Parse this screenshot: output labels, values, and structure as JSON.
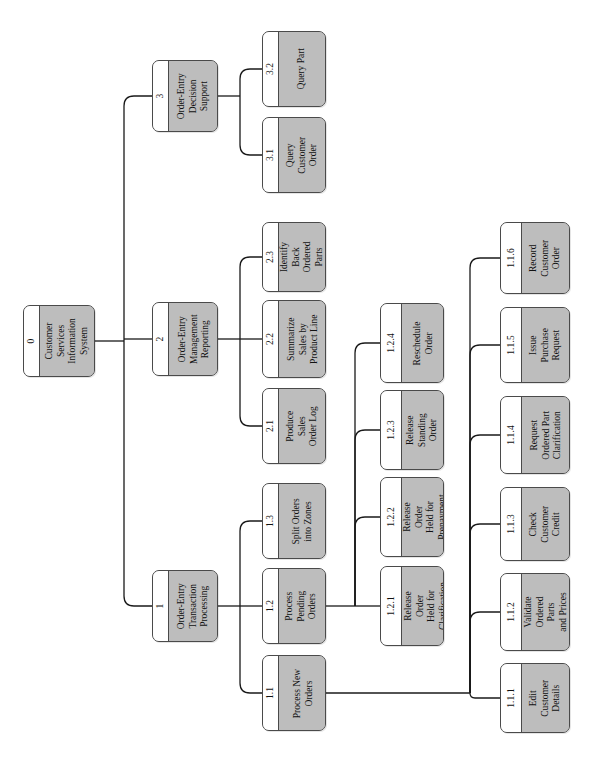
{
  "diagram": {
    "orientation": "rotated-90",
    "background_color": "#ffffff",
    "node_fill_color": "#bdbdbd",
    "node_id_strip_color": "#ffffff",
    "node_border_color": "#4a4a4a",
    "edge_color": "#1a1a1a"
  },
  "nodes": [
    {
      "key": "n0",
      "id": "0",
      "label": "Customer\nServices\nInformation\nSystem",
      "level": 0,
      "x": 23,
      "y": 305,
      "w": 72,
      "h": 72
    },
    {
      "key": "n1",
      "id": "1",
      "label": "Order-Entry\nTransaction\nProcessing",
      "level": 1,
      "x": 152,
      "y": 570,
      "w": 66,
      "h": 72
    },
    {
      "key": "n2",
      "id": "2",
      "label": "Order-Entry\nManagement\nReporting",
      "level": 1,
      "x": 152,
      "y": 302,
      "w": 66,
      "h": 74
    },
    {
      "key": "n3",
      "id": "3",
      "label": "Order-Entry\nDecision\nSupport",
      "level": 1,
      "x": 152,
      "y": 60,
      "w": 66,
      "h": 72
    },
    {
      "key": "n11",
      "id": "1.1",
      "label": "Process New\nOrders",
      "level": 2,
      "x": 262,
      "y": 655,
      "w": 64,
      "h": 76
    },
    {
      "key": "n12",
      "id": "1.2",
      "label": "Process\nPending\nOrders",
      "level": 2,
      "x": 262,
      "y": 568,
      "w": 64,
      "h": 76
    },
    {
      "key": "n13",
      "id": "1.3",
      "label": "Split Orders\ninto Zones",
      "level": 2,
      "x": 262,
      "y": 483,
      "w": 64,
      "h": 76
    },
    {
      "key": "n21",
      "id": "2.1",
      "label": "Produce\nSales\nOrder Log",
      "level": 2,
      "x": 262,
      "y": 388,
      "w": 64,
      "h": 76
    },
    {
      "key": "n22",
      "id": "2.2",
      "label": "Summarize\nSales by\nProduct Line",
      "level": 2,
      "x": 262,
      "y": 300,
      "w": 64,
      "h": 78
    },
    {
      "key": "n23",
      "id": "2.3",
      "label": "Identify\nBack\nOrdered\nParts",
      "level": 2,
      "x": 262,
      "y": 222,
      "w": 64,
      "h": 70
    },
    {
      "key": "n31",
      "id": "3.1",
      "label": "Query\nCustomer\nOrder",
      "level": 2,
      "x": 262,
      "y": 117,
      "w": 64,
      "h": 76
    },
    {
      "key": "n32",
      "id": "3.2",
      "label": "Query Part",
      "level": 2,
      "x": 262,
      "y": 31,
      "w": 64,
      "h": 76
    },
    {
      "key": "n121",
      "id": "1.2.1",
      "label": "Release\nOrder\nHeld for\nClarification",
      "level": 3,
      "x": 380,
      "y": 566,
      "w": 64,
      "h": 80
    },
    {
      "key": "n122",
      "id": "1.2.2",
      "label": "Release\nOrder\nHeld for\nPrepayment",
      "level": 3,
      "x": 380,
      "y": 477,
      "w": 64,
      "h": 80
    },
    {
      "key": "n123",
      "id": "1.2.3",
      "label": "Release\nStanding\nOrder",
      "level": 3,
      "x": 380,
      "y": 390,
      "w": 64,
      "h": 80
    },
    {
      "key": "n124",
      "id": "1.2.4",
      "label": "Reschedule\nOrder",
      "level": 3,
      "x": 380,
      "y": 303,
      "w": 64,
      "h": 80
    },
    {
      "key": "n111",
      "id": "1.1.1",
      "label": "Edit\nCustomer\nDetails",
      "level": 3,
      "x": 500,
      "y": 663,
      "w": 70,
      "h": 70
    },
    {
      "key": "n112",
      "id": "1.1.2",
      "label": "Validate\nOrdered\nParts\nand Prices",
      "level": 3,
      "x": 500,
      "y": 573,
      "w": 70,
      "h": 78
    },
    {
      "key": "n113",
      "id": "1.1.3",
      "label": "Check\nCustomer\nCredit",
      "level": 3,
      "x": 500,
      "y": 487,
      "w": 70,
      "h": 74
    },
    {
      "key": "n114",
      "id": "1.1.4",
      "label": "Request\nOrdered Part\nClarification",
      "level": 3,
      "x": 500,
      "y": 396,
      "w": 70,
      "h": 78
    },
    {
      "key": "n115",
      "id": "1.1.5",
      "label": "Issue\nPurchase\nRequest",
      "level": 3,
      "x": 500,
      "y": 307,
      "w": 70,
      "h": 76
    },
    {
      "key": "n116",
      "id": "1.1.6",
      "label": "Record\nCustomer\nOrder",
      "level": 3,
      "x": 500,
      "y": 222,
      "w": 70,
      "h": 72
    }
  ],
  "edges": [
    {
      "from": "0",
      "to": "1"
    },
    {
      "from": "0",
      "to": "2"
    },
    {
      "from": "0",
      "to": "3"
    },
    {
      "from": "1",
      "to": "1.1"
    },
    {
      "from": "1",
      "to": "1.2"
    },
    {
      "from": "1",
      "to": "1.3"
    },
    {
      "from": "2",
      "to": "2.1"
    },
    {
      "from": "2",
      "to": "2.2"
    },
    {
      "from": "2",
      "to": "2.3"
    },
    {
      "from": "3",
      "to": "3.1"
    },
    {
      "from": "3",
      "to": "3.2"
    },
    {
      "from": "1.2",
      "to": "1.2.1"
    },
    {
      "from": "1.2",
      "to": "1.2.2"
    },
    {
      "from": "1.2",
      "to": "1.2.3"
    },
    {
      "from": "1.2",
      "to": "1.2.4"
    },
    {
      "from": "1.1",
      "to": "1.1.1"
    },
    {
      "from": "1.1",
      "to": "1.1.2"
    },
    {
      "from": "1.1",
      "to": "1.1.3"
    },
    {
      "from": "1.1",
      "to": "1.1.4"
    },
    {
      "from": "1.1",
      "to": "1.1.5"
    },
    {
      "from": "1.1",
      "to": "1.1.6"
    }
  ]
}
